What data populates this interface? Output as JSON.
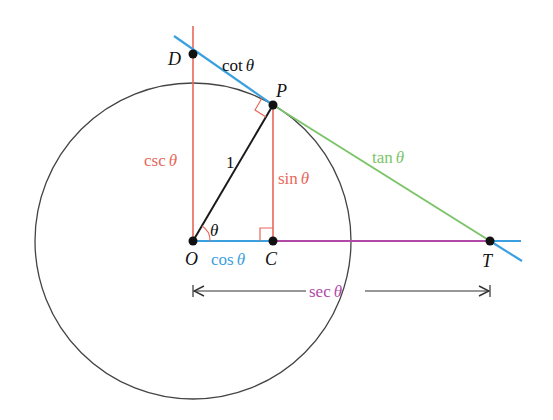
{
  "colors": {
    "circle": "#333333",
    "radius": "#1a1a1a",
    "red": "#e8685a",
    "blue": "#3aa0e0",
    "green": "#7cc46a",
    "purple": "#b04aa6",
    "arrow": "#333333",
    "point": "#111111"
  },
  "points": {
    "O": {
      "label": "O",
      "x": 193,
      "y": 241
    },
    "C": {
      "label": "C",
      "x": 273,
      "y": 241
    },
    "P": {
      "label": "P",
      "x": 273,
      "y": 105
    },
    "D": {
      "label": "D",
      "x": 193,
      "y": 54
    },
    "T": {
      "label": "T",
      "x": 490,
      "y": 241
    }
  },
  "circle": {
    "cx": 193,
    "cy": 241,
    "r": 158
  },
  "labels": {
    "cot": {
      "fn": "cot",
      "arg": "θ"
    },
    "csc": {
      "fn": "csc",
      "arg": "θ"
    },
    "sin": {
      "fn": "sin",
      "arg": "θ"
    },
    "cos": {
      "fn": "cos",
      "arg": "θ"
    },
    "tan": {
      "fn": "tan",
      "arg": "θ"
    },
    "sec": {
      "fn": "sec",
      "arg": "θ"
    },
    "one": "1",
    "theta": "θ"
  }
}
